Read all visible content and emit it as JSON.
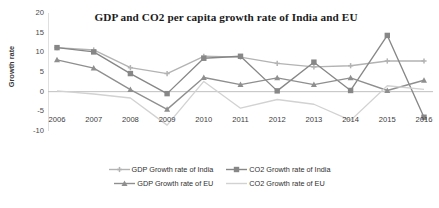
{
  "chart_data": {
    "type": "line",
    "title": "GDP and CO2 per capita growth rate of India and EU",
    "xlabel": "",
    "ylabel": "Growth rate",
    "categories": [
      "2006",
      "2007",
      "2008",
      "2009",
      "2010",
      "2011",
      "2012",
      "2013",
      "2014",
      "2015",
      "2016"
    ],
    "ylim": [
      -10,
      20
    ],
    "yticks": [
      20,
      15,
      10,
      5,
      0,
      -5,
      -10
    ],
    "grid": false,
    "legend_position": "bottom",
    "series": [
      {
        "name": "GDP Growth rate of India",
        "marker": "cross",
        "color": "#b3b3b3",
        "values": [
          11.2,
          10.6,
          6.1,
          4.6,
          9.0,
          8.8,
          7.2,
          6.3,
          6.6,
          7.8,
          7.8
        ]
      },
      {
        "name": "CO2  Growth rate of India",
        "marker": "square",
        "color": "#878787",
        "values": [
          11.2,
          10.1,
          4.6,
          -0.5,
          8.5,
          9.0,
          0.2,
          7.5,
          0.3,
          14.3,
          -6.5
        ]
      },
      {
        "name": "GDP Growth  rate of EU",
        "marker": "triangle",
        "color": "#8f8f8f",
        "values": [
          8.1,
          6.0,
          0.5,
          -4.5,
          3.6,
          1.8,
          3.5,
          1.8,
          3.5,
          0.3,
          2.9
        ]
      },
      {
        "name": "CO2  Growth  rate of EU",
        "marker": "none",
        "color": "#d2d2d2",
        "values": [
          0.2,
          -0.6,
          -1.6,
          -8.5,
          2.6,
          -4.2,
          -2.0,
          -3.2,
          -7.3,
          1.5,
          0.6
        ]
      }
    ]
  },
  "colors": {
    "axis": "#bfbfbf",
    "text": "#3c3c3c",
    "title": "#1b1b1b",
    "gdp_india": "#b3b3b3",
    "co2_india": "#878787",
    "gdp_eu": "#8f8f8f",
    "co2_eu": "#d2d2d2"
  }
}
